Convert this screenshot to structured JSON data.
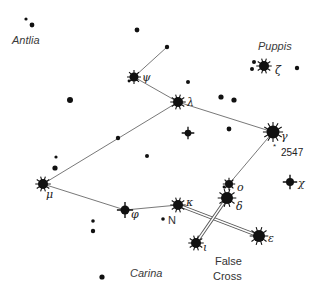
{
  "colors": {
    "star": "#111111",
    "line": "#555555",
    "label": "#333333",
    "background": "#ffffff"
  },
  "constellation_labels": [
    {
      "id": "antlia",
      "text": "Antlia",
      "x": 12,
      "y": 44
    },
    {
      "id": "puppis",
      "text": "Puppis",
      "x": 258,
      "y": 50
    },
    {
      "id": "carina",
      "text": "Carina",
      "x": 130,
      "y": 277
    }
  ],
  "asterism_label": {
    "line1": "False",
    "line2": "Cross",
    "x": 215,
    "y1": 265,
    "y2": 280
  },
  "named_stars": [
    {
      "id": "psi",
      "greek": "ψ",
      "x": 134,
      "y": 77,
      "r": 4.5,
      "spikes": 8,
      "lx": 142,
      "ly": 81
    },
    {
      "id": "lambda",
      "greek": "λ",
      "x": 178,
      "y": 102,
      "r": 5,
      "spikes": 10,
      "lx": 187,
      "ly": 106
    },
    {
      "id": "zeta",
      "greek": "ζ",
      "x": 264,
      "y": 66,
      "r": 5,
      "spikes": 10,
      "lx": 275,
      "ly": 74
    },
    {
      "id": "gamma",
      "greek": "γ",
      "x": 273,
      "y": 132,
      "r": 6.5,
      "spikes": 12,
      "lx": 281,
      "ly": 140
    },
    {
      "id": "mu",
      "greek": "μ",
      "x": 43,
      "y": 184,
      "r": 5,
      "spikes": 10,
      "lx": 46,
      "ly": 198
    },
    {
      "id": "phi",
      "greek": "φ",
      "x": 125,
      "y": 210,
      "r": 4.5,
      "spikes": 4,
      "lx": 131,
      "ly": 218
    },
    {
      "id": "kappa",
      "greek": "κ",
      "x": 178,
      "y": 205,
      "r": 5,
      "spikes": 10,
      "lx": 186,
      "ly": 206
    },
    {
      "id": "omicron",
      "greek": "o",
      "x": 229,
      "y": 184,
      "r": 4,
      "spikes": 8,
      "lx": 237,
      "ly": 191
    },
    {
      "id": "delta",
      "greek": "δ",
      "x": 227,
      "y": 198,
      "r": 6,
      "spikes": 10,
      "lx": 236,
      "ly": 210
    },
    {
      "id": "chi",
      "greek": "χ",
      "x": 290,
      "y": 182,
      "r": 4,
      "spikes": 4,
      "lx": 298,
      "ly": 187
    },
    {
      "id": "epsilon",
      "greek": "ε",
      "x": 259,
      "y": 236,
      "r": 6,
      "spikes": 10,
      "lx": 268,
      "ly": 242
    },
    {
      "id": "iota",
      "greek": "ι",
      "x": 196,
      "y": 243,
      "r": 5,
      "spikes": 10,
      "lx": 203,
      "ly": 251
    }
  ],
  "other_labels": [
    {
      "id": "ngc2547",
      "text": "2547",
      "x": 281,
      "y": 155,
      "marker_x": 277,
      "marker_y": 146
    },
    {
      "id": "n-star",
      "text": "N",
      "x": 168,
      "y": 223
    }
  ],
  "plain_stars": [
    {
      "x": 26,
      "y": 19,
      "r": 1.6
    },
    {
      "x": 32,
      "y": 25,
      "r": 2.4
    },
    {
      "x": 137,
      "y": 30,
      "r": 2.4
    },
    {
      "x": 167,
      "y": 47,
      "r": 2.2
    },
    {
      "x": 129,
      "y": 81,
      "r": 1.4
    },
    {
      "x": 70,
      "y": 100,
      "r": 3
    },
    {
      "x": 188,
      "y": 82,
      "r": 2
    },
    {
      "x": 221,
      "y": 97,
      "r": 2.6
    },
    {
      "x": 234,
      "y": 100,
      "r": 2.6
    },
    {
      "x": 229,
      "y": 129,
      "r": 2.4
    },
    {
      "x": 118,
      "y": 138,
      "r": 2.2
    },
    {
      "x": 147,
      "y": 156,
      "r": 2
    },
    {
      "x": 254,
      "y": 62,
      "r": 2
    },
    {
      "x": 252,
      "y": 69,
      "r": 2
    },
    {
      "x": 297,
      "y": 68,
      "r": 2.2
    },
    {
      "x": 56,
      "y": 157,
      "r": 1.6
    },
    {
      "x": 55,
      "y": 168,
      "r": 2.6
    },
    {
      "x": 93,
      "y": 221,
      "r": 1.8
    },
    {
      "x": 93,
      "y": 231,
      "r": 2.2
    },
    {
      "x": 102,
      "y": 277,
      "r": 2.6
    },
    {
      "x": 163,
      "y": 219,
      "r": 1.8
    },
    {
      "x": 224,
      "y": 187,
      "r": 1.4
    }
  ],
  "four_point_stars": [
    {
      "x": 188,
      "y": 133,
      "r": 4.5
    }
  ],
  "lines": [
    {
      "from": [
        134,
        77
      ],
      "to": [
        167,
        47
      ]
    },
    {
      "from": [
        134,
        77
      ],
      "to": [
        178,
        102
      ]
    },
    {
      "from": [
        178,
        102
      ],
      "to": [
        273,
        132
      ]
    },
    {
      "from": [
        178,
        102
      ],
      "to": [
        43,
        184
      ]
    },
    {
      "from": [
        43,
        184
      ],
      "to": [
        125,
        210
      ]
    },
    {
      "from": [
        125,
        210
      ],
      "to": [
        178,
        205
      ]
    },
    {
      "from": [
        273,
        132
      ],
      "to": [
        229,
        184
      ]
    }
  ],
  "double_lines": [
    {
      "from": [
        178,
        205
      ],
      "to": [
        259,
        236
      ]
    },
    {
      "from": [
        227,
        198
      ],
      "to": [
        196,
        243
      ]
    }
  ]
}
